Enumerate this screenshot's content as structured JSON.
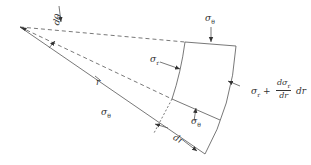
{
  "diagram": {
    "labels": {
      "d_theta": "dθ",
      "r": "r",
      "sigma_theta_top": "σ",
      "sigma_theta_top_sub": "θ",
      "sigma_r_inner": "σ",
      "sigma_r_inner_sub": "r",
      "sigma_theta_bottom": "σ",
      "sigma_theta_bottom_sub": "θ",
      "sigma_theta_left": "σ",
      "sigma_theta_left_sub": "θ",
      "dr": "dr",
      "sigma_r_outer_prefix": "σ",
      "sigma_r_outer_prefix_sub": "r",
      "sigma_r_outer_plus": "+",
      "frac_num": "dσ",
      "frac_num_sub": "r",
      "frac_den": "dr",
      "sigma_r_outer_suffix": "dr"
    },
    "colors": {
      "line": "#444444",
      "text": "#333333",
      "background": "#ffffff"
    }
  }
}
